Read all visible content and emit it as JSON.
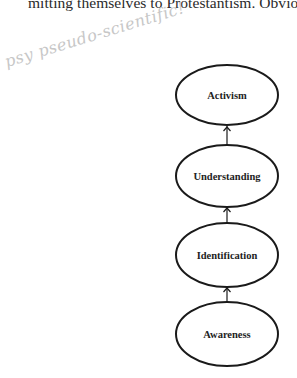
{
  "document": {
    "top_text": "mitting themselves to Protestantism. Obviously, t",
    "handwritten_note": "psy pseudo-scientific!"
  },
  "diagram": {
    "type": "vertical flow",
    "direction": "bottom-to-top",
    "nodes": [
      {
        "label": "Activism",
        "cx": 227,
        "cy": 95
      },
      {
        "label": "Understanding",
        "cx": 227,
        "cy": 176
      },
      {
        "label": "Identification",
        "cx": 227,
        "cy": 255
      },
      {
        "label": "Awareness",
        "cx": 227,
        "cy": 334
      }
    ],
    "edges": [
      {
        "from": "Awareness",
        "to": "Identification"
      },
      {
        "from": "Identification",
        "to": "Understanding"
      },
      {
        "from": "Understanding",
        "to": "Activism"
      }
    ],
    "stroke_color": "#1a1a1a"
  }
}
